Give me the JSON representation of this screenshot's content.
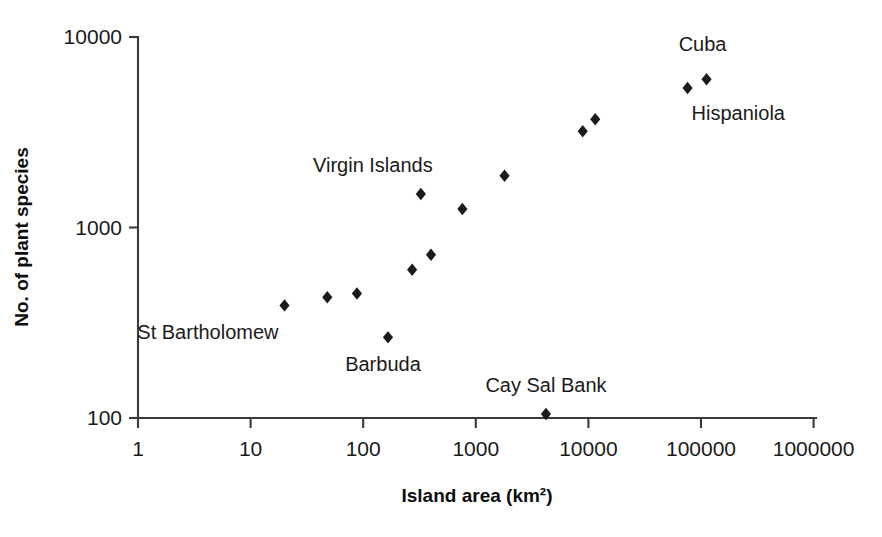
{
  "chart_data": {
    "type": "scatter",
    "title": "",
    "xlabel": "Island area (km²)",
    "ylabel": "No. of plant species",
    "xscale": "log",
    "yscale": "log",
    "xlim": [
      1,
      1000000
    ],
    "ylim": [
      100,
      10000
    ],
    "grid": false,
    "legend": false,
    "marker": "diamond",
    "marker_color": "#1b1b1b",
    "axis_color": "#3a3a3a",
    "xticks": [
      {
        "value": 1,
        "label": "1"
      },
      {
        "value": 10,
        "label": "10"
      },
      {
        "value": 100,
        "label": "100"
      },
      {
        "value": 1000,
        "label": "1000"
      },
      {
        "value": 10000,
        "label": "10000"
      },
      {
        "value": 100000,
        "label": "100000"
      },
      {
        "value": 1000000,
        "label": "1000000"
      }
    ],
    "yticks": [
      {
        "value": 100,
        "label": "100"
      },
      {
        "value": 1000,
        "label": "1000"
      },
      {
        "value": 10000,
        "label": "10000"
      }
    ],
    "points": [
      {
        "name": "point-1",
        "x": 20,
        "y": 390
      },
      {
        "name": "point-2",
        "x": 48,
        "y": 430
      },
      {
        "name": "point-3",
        "x": 88,
        "y": 450
      },
      {
        "name": "point-4",
        "x": 166,
        "y": 265
      },
      {
        "name": "point-5",
        "x": 272,
        "y": 600
      },
      {
        "name": "point-6",
        "x": 325,
        "y": 1500
      },
      {
        "name": "point-7",
        "x": 400,
        "y": 720
      },
      {
        "name": "point-8",
        "x": 760,
        "y": 1250
      },
      {
        "name": "point-9",
        "x": 1800,
        "y": 1870
      },
      {
        "name": "point-10",
        "x": 4200,
        "y": 105
      },
      {
        "name": "point-11",
        "x": 8900,
        "y": 3200
      },
      {
        "name": "point-12",
        "x": 11500,
        "y": 3700
      },
      {
        "name": "point-13",
        "x": 76000,
        "y": 5400
      },
      {
        "name": "point-14",
        "x": 112000,
        "y": 6000
      }
    ],
    "annotations": [
      {
        "name": "st-bartholomew",
        "text": "St Bartholomew",
        "x": 20,
        "y": 390,
        "dx": -6,
        "dy": 34,
        "anchor": "end"
      },
      {
        "name": "barbuda",
        "text": "Barbuda",
        "x": 166,
        "y": 265,
        "dx": -5,
        "dy": 34,
        "anchor": "middle"
      },
      {
        "name": "virgin-islands",
        "text": "Virgin Islands",
        "x": 325,
        "y": 1500,
        "dx": -48,
        "dy": -22,
        "anchor": "middle"
      },
      {
        "name": "cay-sal-bank",
        "text": "Cay Sal Bank",
        "x": 4200,
        "y": 105,
        "dx": 0,
        "dy": -22,
        "anchor": "middle"
      },
      {
        "name": "hispaniola",
        "text": "Hispaniola",
        "x": 76000,
        "y": 5400,
        "dx": 4,
        "dy": 32,
        "anchor": "start"
      },
      {
        "name": "cuba",
        "text": "Cuba",
        "x": 112000,
        "y": 6000,
        "dx": -4,
        "dy": -28,
        "anchor": "middle"
      }
    ]
  }
}
